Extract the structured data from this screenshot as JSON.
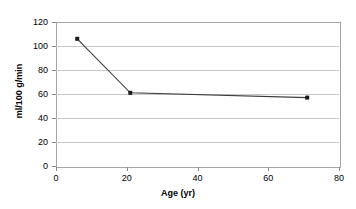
{
  "chart_data": {
    "type": "line",
    "title": "",
    "xlabel": "Age (yr)",
    "ylabel": "ml/100 g/min",
    "xlim": [
      0,
      80
    ],
    "ylim": [
      0,
      120
    ],
    "grid": true,
    "legend": false,
    "marker": "square",
    "x_ticks": [
      "0",
      "20",
      "40",
      "60",
      "80"
    ],
    "y_ticks": [
      "0",
      "20",
      "40",
      "60",
      "80",
      "100",
      "120"
    ],
    "series": [
      {
        "name": "Cerebral blood flow",
        "x": [
          6,
          21,
          71
        ],
        "values": [
          106,
          61,
          57
        ]
      }
    ]
  }
}
